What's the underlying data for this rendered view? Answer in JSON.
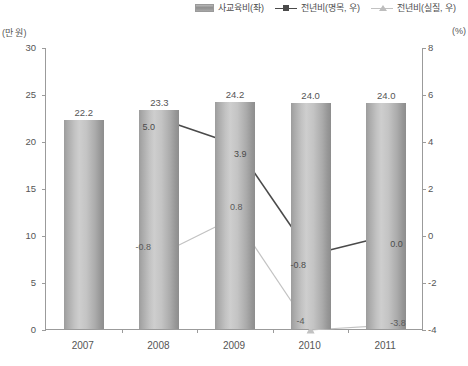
{
  "units": {
    "left_axis_unit": "(만 원)",
    "right_axis_unit": "(%)"
  },
  "legend": {
    "items": [
      {
        "label": "사교육비(좌)",
        "icon": "bar-swatch-icon",
        "color": "#a8a8a8"
      },
      {
        "label": "전년비(명목, 우)",
        "icon": "line-square-marker-icon",
        "color": "#4a4a4a"
      },
      {
        "label": "전년비(실질, 우)",
        "icon": "line-triangle-marker-icon",
        "color": "#c2c2c2"
      }
    ]
  },
  "chart_data": {
    "type": "bar",
    "title": "",
    "xlabel": "",
    "ylabel": "(만 원)",
    "y2label": "(%)",
    "categories": [
      "2007",
      "2008",
      "2009",
      "2010",
      "2011"
    ],
    "ylim": [
      0,
      30
    ],
    "y2lim": [
      -4,
      8
    ],
    "yticks": [
      "0",
      "5",
      "10",
      "15",
      "20",
      "25",
      "30"
    ],
    "y2ticks": [
      "-4",
      "-2",
      "0",
      "2",
      "4",
      "6",
      "8"
    ],
    "grid": false,
    "legend_position": "top-right",
    "series": [
      {
        "name": "사교육비(좌)",
        "type": "bar",
        "axis": "left",
        "values": [
          22.2,
          23.3,
          24.2,
          24.0,
          24.0
        ],
        "labels": [
          "22.2",
          "23.3",
          "24.2",
          "24.0",
          "24.0"
        ],
        "color": "#b5b5b5"
      },
      {
        "name": "전년비(명목, 우)",
        "type": "line",
        "axis": "right",
        "marker": "square",
        "values": [
          null,
          5.0,
          3.9,
          -0.8,
          0.0
        ],
        "labels": [
          "",
          "5.0",
          "3.9",
          "-0.8",
          "0.0"
        ],
        "color": "#4a4a4a"
      },
      {
        "name": "전년비(실질, 우)",
        "type": "line",
        "axis": "right",
        "marker": "triangle",
        "values": [
          null,
          -0.8,
          0.8,
          -4.0,
          -3.8
        ],
        "labels": [
          "",
          "-0.8",
          "0.8",
          "-4",
          "-3.8"
        ],
        "color": "#c2c2c2"
      }
    ]
  }
}
